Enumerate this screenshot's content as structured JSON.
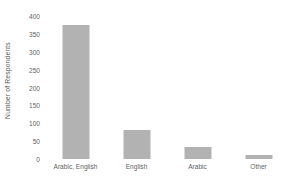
{
  "chart_data": {
    "type": "bar",
    "title": "",
    "subtitle": "",
    "xlabel": "",
    "ylabel": "Number of Respondents",
    "categories": [
      "Arabic, English",
      "English",
      "Arabic",
      "Other"
    ],
    "values": [
      375,
      81,
      34,
      10
    ],
    "series": [
      {
        "name": "Number of Respondents",
        "values": [
          375,
          81,
          34,
          10
        ]
      }
    ],
    "ylim": [
      0,
      400
    ],
    "yticks": [
      0,
      50,
      100,
      150,
      200,
      250,
      300,
      350,
      400
    ],
    "ytick_labels": [
      "0",
      "50",
      "100",
      "150",
      "200",
      "250",
      "300",
      "350",
      "400"
    ],
    "grid": false,
    "legend": false,
    "legend_position": "none",
    "bar_color": "#b2b2b2",
    "background_color": "#ffffff",
    "text_color": "#5f5f5f",
    "axis_line": false
  }
}
